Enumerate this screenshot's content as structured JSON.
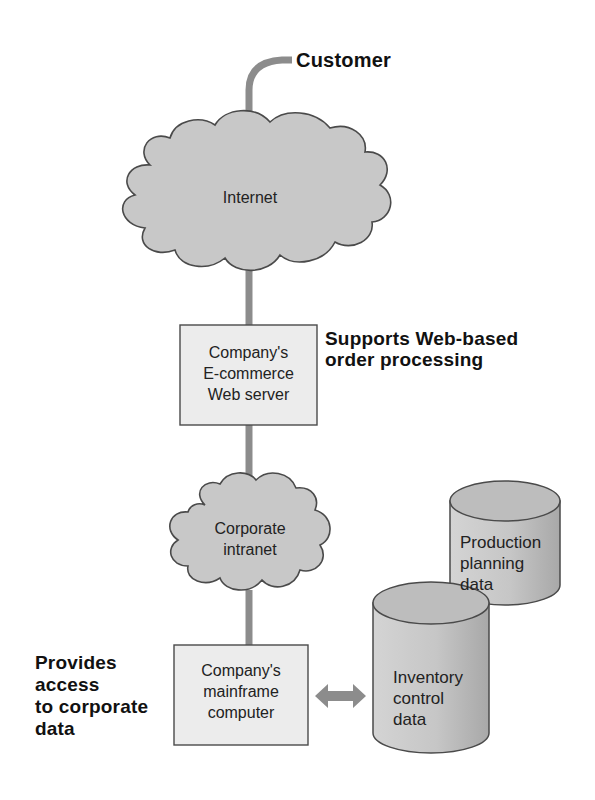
{
  "diagram": {
    "type": "network-architecture",
    "colors": {
      "connector": "#8c8c8c",
      "cloud_fill": "#c8c8c8",
      "box_fill": "#ececec",
      "cylinder_fill": "#c4c4c4",
      "outline": "#4a4a4a"
    },
    "nodes": {
      "customer": {
        "label": "Customer"
      },
      "internet": {
        "label": "Internet"
      },
      "web_server": {
        "line1": "Company's",
        "line2": "E-commerce",
        "line3": "Web server"
      },
      "intranet": {
        "line1": "Corporate",
        "line2": "intranet"
      },
      "mainframe": {
        "line1": "Company's",
        "line2": "mainframe",
        "line3": "computer"
      },
      "production_db": {
        "line1": "Production",
        "line2": "planning",
        "line3": "data"
      },
      "inventory_db": {
        "line1": "Inventory",
        "line2": "control",
        "line3": "data"
      }
    },
    "annotations": {
      "web_server_note": {
        "line1": "Supports Web-based",
        "line2": "order processing"
      },
      "mainframe_note": {
        "line1": "Provides",
        "line2": "access",
        "line3": "to corporate",
        "line4": "data"
      }
    },
    "edges": [
      {
        "from": "customer",
        "to": "internet"
      },
      {
        "from": "internet",
        "to": "web_server"
      },
      {
        "from": "web_server",
        "to": "intranet"
      },
      {
        "from": "intranet",
        "to": "mainframe"
      },
      {
        "from": "mainframe",
        "to": "inventory_db",
        "bidirectional": true
      }
    ]
  }
}
